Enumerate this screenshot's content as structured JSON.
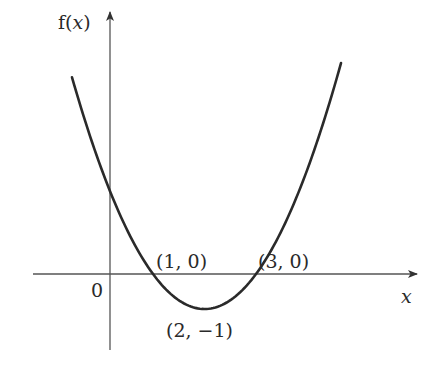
{
  "chart_data": {
    "type": "line",
    "title": "",
    "function": "f(x) = (x - 1)(x - 3) = x^2 - 4x + 3",
    "xlabel": "x",
    "ylabel": "f(x)",
    "origin_label": "0",
    "grid": false,
    "legend": null,
    "key_points": [
      {
        "x": 1,
        "y": 0,
        "label": "(1, 0)"
      },
      {
        "x": 3,
        "y": 0,
        "label": "(3, 0)"
      },
      {
        "x": 2,
        "y": -1,
        "label": "(2, −1)"
      }
    ],
    "series": [
      {
        "name": "f(x)",
        "x": [
          -0.8,
          -0.5,
          0,
          0.5,
          1,
          1.5,
          2,
          2.5,
          3,
          3.5,
          4,
          4.5,
          4.8
        ],
        "values": [
          6.84,
          5.25,
          3,
          1.25,
          0,
          -0.75,
          -1,
          -0.75,
          0,
          1.25,
          3,
          5.25,
          6.84
        ]
      }
    ],
    "axis_arrows": {
      "x": true,
      "y": true
    },
    "line_color": "#2a2a2a",
    "axis_color": "#555555"
  }
}
